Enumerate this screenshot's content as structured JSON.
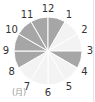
{
  "chart_data": {
    "type": "pie",
    "title": "",
    "unit_label": "(月)",
    "labels": [
      "1",
      "2",
      "3",
      "4",
      "5",
      "6",
      "7",
      "8",
      "9",
      "10",
      "11",
      "12"
    ],
    "segments": [
      {
        "from": "1",
        "to": "2",
        "highlighted": false
      },
      {
        "from": "2",
        "to": "3",
        "highlighted": false
      },
      {
        "from": "3",
        "to": "4",
        "highlighted": true
      },
      {
        "from": "4",
        "to": "5",
        "highlighted": false
      },
      {
        "from": "5",
        "to": "6",
        "highlighted": false
      },
      {
        "from": "6",
        "to": "7",
        "highlighted": false
      },
      {
        "from": "7",
        "to": "8",
        "highlighted": false
      },
      {
        "from": "8",
        "to": "9",
        "highlighted": true
      },
      {
        "from": "9",
        "to": "10",
        "highlighted": true
      },
      {
        "from": "10",
        "to": "11",
        "highlighted": true
      },
      {
        "from": "11",
        "to": "12",
        "highlighted": true
      },
      {
        "from": "12",
        "to": "1",
        "highlighted": true
      }
    ],
    "colors": {
      "highlighted": "#a6a6a6",
      "normal": "#f3f3f3",
      "separator": "#ffffff"
    }
  }
}
